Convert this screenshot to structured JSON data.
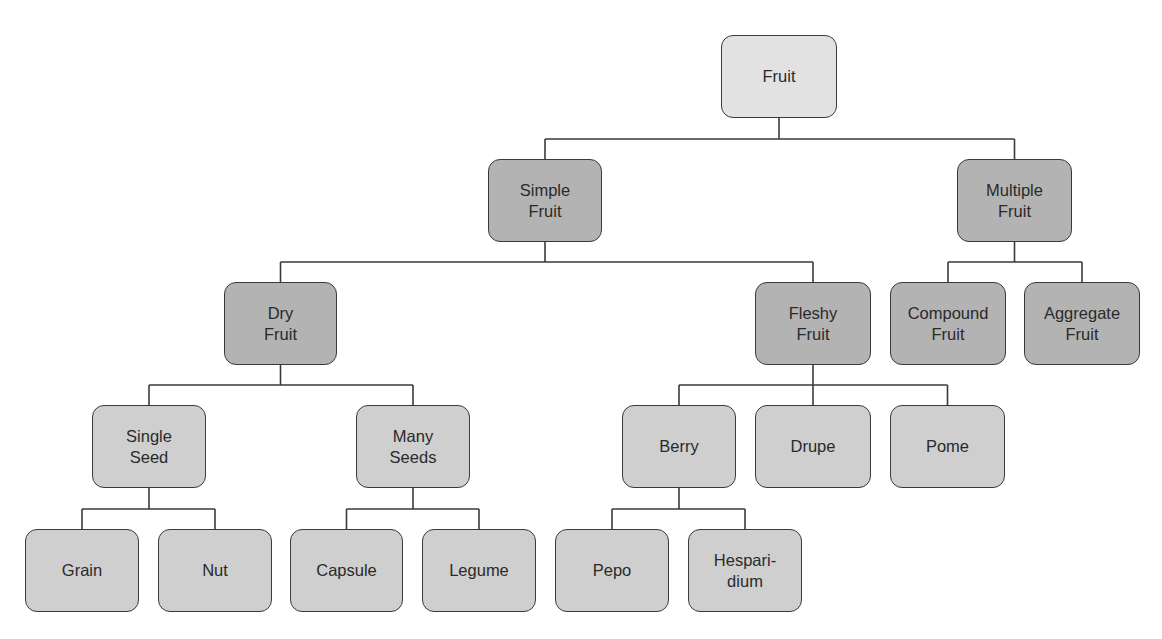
{
  "diagram": {
    "colors": {
      "root_fill": "#e2e2e2",
      "category_fill": "#b3b3b3",
      "type_fill": "#cfcfcf",
      "border": "#3a3a3a",
      "line": "#3a3a3a",
      "text": "#2a2a2a"
    },
    "nodes": [
      {
        "id": "fruit",
        "label": "Fruit",
        "level": 1,
        "style": "light",
        "x": 721,
        "y": 35,
        "w": 116,
        "h": 83
      },
      {
        "id": "simple-fruit",
        "label": "Simple\nFruit",
        "level": 2,
        "style": "dark",
        "parent": "fruit",
        "x": 488,
        "y": 159,
        "w": 114,
        "h": 83
      },
      {
        "id": "multiple-fruit",
        "label": "Multiple\nFruit",
        "level": 2,
        "style": "dark",
        "parent": "fruit",
        "x": 957,
        "y": 159,
        "w": 115,
        "h": 83
      },
      {
        "id": "dry-fruit",
        "label": "Dry\nFruit",
        "level": 3,
        "style": "dark",
        "parent": "simple-fruit",
        "x": 224,
        "y": 282,
        "w": 113,
        "h": 83
      },
      {
        "id": "fleshy-fruit",
        "label": "Fleshy\nFruit",
        "level": 3,
        "style": "dark",
        "parent": "simple-fruit",
        "x": 755,
        "y": 282,
        "w": 116,
        "h": 83
      },
      {
        "id": "compound-fruit",
        "label": "Compound\nFruit",
        "level": 3,
        "style": "dark",
        "parent": "multiple-fruit",
        "x": 890,
        "y": 282,
        "w": 116,
        "h": 83
      },
      {
        "id": "aggregate-fruit",
        "label": "Aggregate\nFruit",
        "level": 3,
        "style": "dark",
        "parent": "multiple-fruit",
        "x": 1024,
        "y": 282,
        "w": 116,
        "h": 83
      },
      {
        "id": "single-seed",
        "label": "Single\nSeed",
        "level": 4,
        "style": "medium",
        "parent": "dry-fruit",
        "x": 92,
        "y": 405,
        "w": 114,
        "h": 83
      },
      {
        "id": "many-seeds",
        "label": "Many\nSeeds",
        "level": 4,
        "style": "medium",
        "parent": "dry-fruit",
        "x": 356,
        "y": 405,
        "w": 114,
        "h": 83
      },
      {
        "id": "berry",
        "label": "Berry",
        "level": 4,
        "style": "medium",
        "parent": "fleshy-fruit",
        "x": 622,
        "y": 405,
        "w": 114,
        "h": 83
      },
      {
        "id": "drupe",
        "label": "Drupe",
        "level": 4,
        "style": "medium",
        "parent": "fleshy-fruit",
        "x": 755,
        "y": 405,
        "w": 116,
        "h": 83
      },
      {
        "id": "pome",
        "label": "Pome",
        "level": 4,
        "style": "medium",
        "parent": "fleshy-fruit",
        "x": 890,
        "y": 405,
        "w": 115,
        "h": 83
      },
      {
        "id": "grain",
        "label": "Grain",
        "level": 5,
        "style": "medium",
        "parent": "single-seed",
        "x": 25,
        "y": 529,
        "w": 114,
        "h": 83
      },
      {
        "id": "nut",
        "label": "Nut",
        "level": 5,
        "style": "medium",
        "parent": "single-seed",
        "x": 158,
        "y": 529,
        "w": 114,
        "h": 83
      },
      {
        "id": "capsule",
        "label": "Capsule",
        "level": 5,
        "style": "medium",
        "parent": "many-seeds",
        "x": 290,
        "y": 529,
        "w": 113,
        "h": 83
      },
      {
        "id": "legume",
        "label": "Legume",
        "level": 5,
        "style": "medium",
        "parent": "many-seeds",
        "x": 422,
        "y": 529,
        "w": 114,
        "h": 83
      },
      {
        "id": "pepo",
        "label": "Pepo",
        "level": 5,
        "style": "medium",
        "parent": "berry",
        "x": 555,
        "y": 529,
        "w": 114,
        "h": 83
      },
      {
        "id": "hesparidium",
        "label": "Hespari-\ndium",
        "level": 5,
        "style": "medium",
        "parent": "berry",
        "x": 688,
        "y": 529,
        "w": 114,
        "h": 83
      }
    ]
  }
}
